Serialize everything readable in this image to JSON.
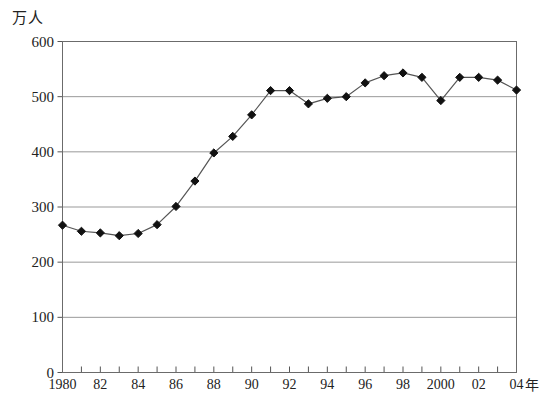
{
  "chart_data": {
    "type": "line",
    "title": "",
    "subtitle": "",
    "xlabel": "年",
    "ylabel": "万人",
    "x": [
      1980,
      1981,
      1982,
      1983,
      1984,
      1985,
      1986,
      1987,
      1988,
      1989,
      1990,
      1991,
      1992,
      1993,
      1994,
      1995,
      1996,
      1997,
      1998,
      1999,
      2000,
      2001,
      2002,
      2003,
      2004
    ],
    "values": [
      267,
      256,
      253,
      248,
      252,
      268,
      301,
      347,
      398,
      428,
      467,
      511,
      511,
      487,
      497,
      500,
      525,
      538,
      543,
      535,
      493,
      535,
      535,
      530,
      512
    ],
    "categories": [
      "1980",
      "1981",
      "1982",
      "1983",
      "1984",
      "1985",
      "1986",
      "1987",
      "1988",
      "1989",
      "1990",
      "1991",
      "1992",
      "1993",
      "1994",
      "1995",
      "1996",
      "1997",
      "1998",
      "1999",
      "2000",
      "2001",
      "2002",
      "2003",
      "2004"
    ],
    "xlim": [
      1980,
      2004
    ],
    "ylim": [
      0,
      600
    ],
    "yticks": [
      0,
      100,
      200,
      300,
      400,
      500,
      600
    ],
    "ytick_labels": [
      "0",
      "100",
      "200",
      "300",
      "400",
      "500",
      "600"
    ],
    "xtick_years": [
      1980,
      1981,
      1982,
      1983,
      1984,
      1985,
      1986,
      1987,
      1988,
      1989,
      1990,
      1991,
      1992,
      1993,
      1994,
      1995,
      1996,
      1997,
      1998,
      1999,
      2000,
      2001,
      2002,
      2003,
      2004
    ],
    "xtick_labels": [
      {
        "year": 1980,
        "label": "1980"
      },
      {
        "year": 1982,
        "label": "82"
      },
      {
        "year": 1984,
        "label": "84"
      },
      {
        "year": 1986,
        "label": "86"
      },
      {
        "year": 1988,
        "label": "88"
      },
      {
        "year": 1990,
        "label": "90"
      },
      {
        "year": 1992,
        "label": "92"
      },
      {
        "year": 1994,
        "label": "94"
      },
      {
        "year": 1996,
        "label": "96"
      },
      {
        "year": 1998,
        "label": "98"
      },
      {
        "year": 2000,
        "label": "2000"
      },
      {
        "year": 2002,
        "label": "02"
      },
      {
        "year": 2004,
        "label": "04"
      }
    ],
    "grid": true,
    "grid_axis": "y",
    "legend": null,
    "legend_position": "none",
    "marker": "diamond",
    "series_color": "#111111",
    "line_color": "#555555",
    "grid_color": "#999999",
    "axis_color": "#555555",
    "background_color": "#ffffff",
    "annotations": []
  }
}
